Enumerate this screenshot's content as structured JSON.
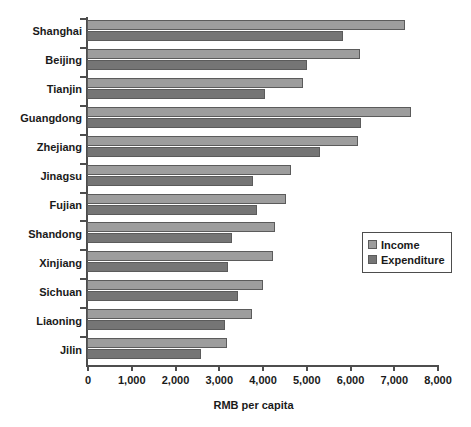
{
  "chart_data": {
    "type": "bar",
    "orientation": "horizontal",
    "title": "",
    "subtitle": "",
    "xlabel": "RMB per capita",
    "ylabel": "",
    "xlim": [
      0,
      8000
    ],
    "xticks": [
      0,
      1000,
      2000,
      3000,
      4000,
      5000,
      6000,
      7000,
      8000
    ],
    "xtick_labels": [
      "0",
      "1,000",
      "2,000",
      "3,000",
      "4,000",
      "5,000",
      "6,000",
      "7,000",
      "8,000"
    ],
    "grid": false,
    "legend_position": "center-right",
    "categories": [
      "Shanghai",
      "Beijing",
      "Tianjin",
      "Guangdong",
      "Zhejiang",
      "Jinagsu",
      "Fujian",
      "Shandong",
      "Xinjiang",
      "Sichuan",
      "Liaoning",
      "Jilin"
    ],
    "series": [
      {
        "name": "Income",
        "color": "#9d9d9d",
        "values": [
          7270,
          6240,
          4940,
          7400,
          6200,
          4660,
          4550,
          4290,
          4250,
          4020,
          3770,
          3190
        ]
      },
      {
        "name": "Expenditure",
        "color": "#757575",
        "values": [
          5850,
          5030,
          4070,
          6270,
          5320,
          3800,
          3890,
          3310,
          3220,
          3450,
          3150,
          2600
        ]
      }
    ]
  },
  "legend": {
    "items": [
      {
        "label": "Income",
        "swatch": "income-swatch"
      },
      {
        "label": "Expenditure",
        "swatch": "expenditure-swatch"
      }
    ]
  },
  "axis": {
    "x_title": "RMB per capita"
  }
}
